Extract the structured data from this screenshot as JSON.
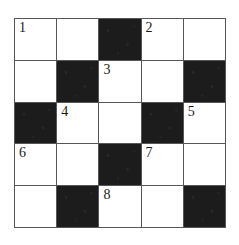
{
  "puzzle": {
    "type": "crossword-grid",
    "rows": 5,
    "columns": 5,
    "colors": {
      "blocked_cell": "#1d1c1c",
      "open_cell": "#ffffff",
      "grid_line": "#55565a",
      "number_text": "#1a1a1a",
      "page_background": "#ffffff"
    },
    "clue_numbers": [
      1,
      2,
      3,
      4,
      5,
      6,
      7,
      8
    ],
    "grid": [
      [
        {
          "state": "open",
          "number": "1"
        },
        {
          "state": "open",
          "number": ""
        },
        {
          "state": "blocked",
          "number": ""
        },
        {
          "state": "open",
          "number": "2"
        },
        {
          "state": "open",
          "number": ""
        }
      ],
      [
        {
          "state": "open",
          "number": ""
        },
        {
          "state": "blocked",
          "number": ""
        },
        {
          "state": "open",
          "number": "3"
        },
        {
          "state": "open",
          "number": ""
        },
        {
          "state": "blocked",
          "number": ""
        }
      ],
      [
        {
          "state": "blocked",
          "number": ""
        },
        {
          "state": "open",
          "number": "4"
        },
        {
          "state": "open",
          "number": ""
        },
        {
          "state": "blocked",
          "number": ""
        },
        {
          "state": "open",
          "number": "5"
        }
      ],
      [
        {
          "state": "open",
          "number": "6"
        },
        {
          "state": "open",
          "number": ""
        },
        {
          "state": "blocked",
          "number": ""
        },
        {
          "state": "open",
          "number": "7"
        },
        {
          "state": "open",
          "number": ""
        }
      ],
      [
        {
          "state": "open",
          "number": ""
        },
        {
          "state": "blocked",
          "number": ""
        },
        {
          "state": "open",
          "number": "8"
        },
        {
          "state": "open",
          "number": ""
        },
        {
          "state": "blocked",
          "number": ""
        }
      ]
    ]
  }
}
